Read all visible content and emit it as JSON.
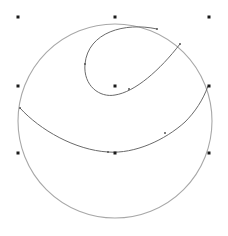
{
  "canvas": {
    "width": 228,
    "height": 236,
    "background": "#ffffff"
  },
  "colors": {
    "circle_stroke": "#a8a8a8",
    "curve_stroke": "#6a6a6a",
    "marker_fill": "#1a1a1a",
    "node_fill": "#555555"
  },
  "outer_circle": {
    "cx": 115,
    "cy": 121,
    "r": 97
  },
  "control_points": [
    {
      "id": "tl",
      "x": 18,
      "y": 17
    },
    {
      "id": "tc",
      "x": 115,
      "y": 17
    },
    {
      "id": "tr",
      "x": 209,
      "y": 17
    },
    {
      "id": "ml",
      "x": 18,
      "y": 86
    },
    {
      "id": "mc",
      "x": 115,
      "y": 86
    },
    {
      "id": "mr",
      "x": 209,
      "y": 86
    },
    {
      "id": "bl",
      "x": 18,
      "y": 153
    },
    {
      "id": "bc",
      "x": 115,
      "y": 153
    },
    {
      "id": "br",
      "x": 209,
      "y": 153
    }
  ],
  "curves": {
    "inner_loop": "M 157 29 C 125 22, 88 32, 85 64 C 83 86, 100 98, 115 95 C 135 92, 160 70, 180 44",
    "lower_arc": "M 20 108 C 40 130, 75 150, 108 152 C 135 154, 165 140, 185 122 C 195 112, 203 100, 208 86"
  },
  "curve_nodes": [
    {
      "x": 157,
      "y": 29
    },
    {
      "x": 85,
      "y": 64
    },
    {
      "x": 129,
      "y": 89
    },
    {
      "x": 180,
      "y": 44
    },
    {
      "x": 20,
      "y": 108
    },
    {
      "x": 108,
      "y": 152
    },
    {
      "x": 165,
      "y": 133
    }
  ]
}
